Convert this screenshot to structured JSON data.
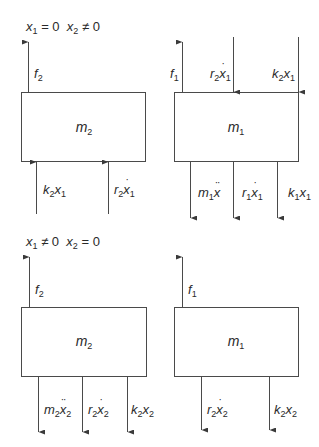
{
  "diagram": {
    "stroke_color": "#4a4a4a",
    "text_color": "#2a2a2a",
    "panels": [
      {
        "id": "top-left",
        "condition": {
          "x1": "x₁ = 0",
          "x2": "x₂ ≠ 0",
          "text": "x1 = 0  x2 ≠ 0"
        },
        "mass": "m2",
        "box": {
          "x": 21,
          "y": 92,
          "w": 124,
          "h": 69
        },
        "forces": [
          {
            "label": "f2",
            "x": 28,
            "from": 92,
            "to": 41,
            "dir": "up",
            "side": "top"
          },
          {
            "label": "k2x1",
            "x": 36,
            "from": 214,
            "to": 161,
            "dir": "up",
            "side": "bottom"
          },
          {
            "label": "r2ẋ1",
            "x": 108,
            "from": 214,
            "to": 161,
            "dir": "up",
            "side": "bottom"
          }
        ]
      },
      {
        "id": "top-right",
        "mass": "m1",
        "box": {
          "x": 174,
          "y": 92,
          "w": 124,
          "h": 69
        },
        "forces": [
          {
            "label": "f1",
            "x": 182,
            "from": 92,
            "to": 41,
            "dir": "up",
            "side": "top"
          },
          {
            "label": "r2ẋ1",
            "x": 233,
            "from": 37,
            "to": 92,
            "dir": "down",
            "side": "top"
          },
          {
            "label": "k2x1",
            "x": 298,
            "from": 37,
            "to": 92,
            "dir": "down",
            "side": "top"
          },
          {
            "label": "m1ẍ",
            "x": 190,
            "from": 161,
            "to": 218,
            "dir": "down",
            "side": "bottom"
          },
          {
            "label": "r1ẋ1",
            "x": 233,
            "from": 161,
            "to": 218,
            "dir": "down",
            "side": "bottom"
          },
          {
            "label": "k1x1",
            "x": 277,
            "from": 161,
            "to": 218,
            "dir": "down",
            "side": "bottom"
          }
        ]
      },
      {
        "id": "bottom-left",
        "condition": {
          "x1": "x₁ ≠ 0",
          "x2": "x₂ = 0",
          "text": "x1 ≠ 0  x2 = 0"
        },
        "mass": "m2",
        "box": {
          "x": 21,
          "y": 307,
          "w": 125,
          "h": 69
        },
        "forces": [
          {
            "label": "f2",
            "x": 29,
            "from": 307,
            "to": 256,
            "dir": "up",
            "side": "top"
          },
          {
            "label": "m2ẍ2",
            "x": 38,
            "from": 376,
            "to": 432,
            "dir": "down",
            "side": "bottom"
          },
          {
            "label": "r2ẋ2",
            "x": 82,
            "from": 376,
            "to": 432,
            "dir": "down",
            "side": "bottom"
          },
          {
            "label": "k2x2",
            "x": 127,
            "from": 376,
            "to": 432,
            "dir": "down",
            "side": "bottom"
          }
        ]
      },
      {
        "id": "bottom-right",
        "mass": "m1",
        "box": {
          "x": 174,
          "y": 307,
          "w": 124,
          "h": 69
        },
        "forces": [
          {
            "label": "f1",
            "x": 182,
            "from": 307,
            "to": 256,
            "dir": "up",
            "side": "top"
          },
          {
            "label": "r2ẋ2",
            "x": 201,
            "from": 376,
            "to": 430,
            "dir": "down",
            "side": "bottom"
          },
          {
            "label": "k2x2",
            "x": 269,
            "from": 376,
            "to": 430,
            "dir": "down",
            "side": "bottom"
          }
        ]
      }
    ]
  },
  "labels": {
    "cond_top": {
      "x1_sym": "x",
      "x1_sub": "1",
      "x1_rel": " = 0",
      "x2_sym": "x",
      "x2_sub": "2",
      "x2_rel": " ≠ 0"
    },
    "cond_bottom": {
      "x1_sym": "x",
      "x1_sub": "1",
      "x1_rel": " ≠ 0",
      "x2_sym": "x",
      "x2_sub": "2",
      "x2_rel": " = 0"
    },
    "m": "m",
    "f": "f",
    "k": "k",
    "r": "r",
    "x": "x",
    "one": "1",
    "two": "2"
  }
}
